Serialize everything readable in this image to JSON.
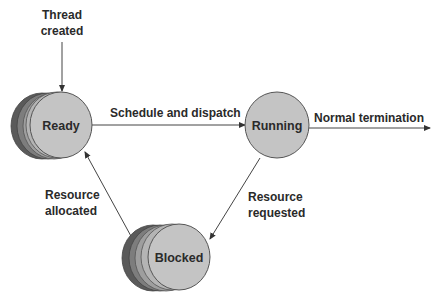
{
  "diagram": {
    "type": "state-transition",
    "colors": {
      "node_fill": "#c4c4c4",
      "stack_shades": [
        "#5a5a5a",
        "#7d7d7d",
        "#9e9e9e",
        "#b4b4b4"
      ],
      "stroke": "#555555",
      "text": "#2a2a2a",
      "background": "#ffffff"
    },
    "nodes": [
      {
        "id": "ready",
        "label": "Ready",
        "stacked": true
      },
      {
        "id": "running",
        "label": "Running",
        "stacked": false
      },
      {
        "id": "blocked",
        "label": "Blocked",
        "stacked": true
      }
    ],
    "edges": [
      {
        "from": "start",
        "to": "ready",
        "label_lines": [
          "Thread",
          "created"
        ]
      },
      {
        "from": "ready",
        "to": "running",
        "label": "Schedule and dispatch"
      },
      {
        "from": "running",
        "to": "end",
        "label": "Normal termination"
      },
      {
        "from": "running",
        "to": "blocked",
        "label_lines": [
          "Resource",
          "requested"
        ]
      },
      {
        "from": "blocked",
        "to": "ready",
        "label_lines": [
          "Resource",
          "allocated"
        ]
      }
    ]
  }
}
